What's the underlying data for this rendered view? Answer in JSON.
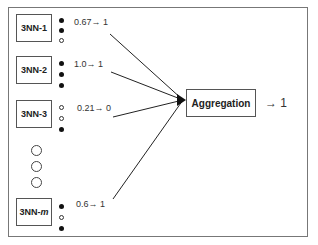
{
  "diagram": {
    "type": "ensemble-aggregation",
    "classifiers": [
      {
        "name": "3NN-1",
        "votes": [
          "filled",
          "filled",
          "open"
        ],
        "score": "0.67",
        "prediction": "1",
        "top": 14
      },
      {
        "name": "3NN-2",
        "votes": [
          "filled",
          "filled",
          "filled"
        ],
        "score": "1.0",
        "prediction": "1",
        "top": 57
      },
      {
        "name": "3NN-3",
        "votes": [
          "open",
          "open",
          "filled"
        ],
        "score": "0.21",
        "prediction": "0",
        "top": 100
      },
      {
        "name": "3NN-",
        "name_suffix_italic": "m",
        "votes": [
          "filled",
          "open",
          "filled"
        ],
        "score": "0.6",
        "prediction": "1",
        "top": 197
      }
    ],
    "labels": {
      "c1": "0.67→ 1",
      "c2": "1.0→ 1",
      "c3": "0.21→ 0",
      "cm": "0.6→ 1",
      "c1_name": "3NN-1",
      "c2_name": "3NN-2",
      "c3_name": "3NN-3",
      "cm_name_prefix": "3NN-",
      "cm_name_suffix": "m"
    },
    "ellipsis": "vertical-circles",
    "aggregator": {
      "label": "Aggregation",
      "output": "→ 1"
    }
  }
}
